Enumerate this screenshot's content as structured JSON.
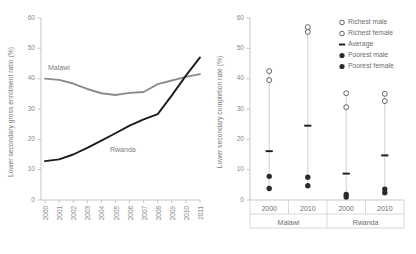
{
  "figure": {
    "title": "",
    "panels": [
      "enrolment-trend",
      "completion-equity"
    ]
  },
  "chart_data": [
    {
      "type": "line",
      "id": "lower-secondary-gross-enrolment-ratio",
      "title": "",
      "xlabel": "",
      "ylabel": "Lower secondary gross enrolment ratio (%)",
      "x": [
        2000,
        2001,
        2002,
        2003,
        2004,
        2005,
        2006,
        2007,
        2008,
        2009,
        2010,
        2011
      ],
      "xtick_labels": [
        "2000",
        "2001",
        "2002",
        "2003",
        "2004",
        "2005",
        "2006",
        "2007",
        "2008",
        "2009",
        "2010",
        "2011"
      ],
      "ytick_labels": [
        "0",
        "10",
        "20",
        "30",
        "40",
        "50",
        "60"
      ],
      "yticks": [
        0,
        10,
        20,
        30,
        40,
        50,
        60
      ],
      "ylim": [
        0,
        60
      ],
      "xlim": [
        2000,
        2011
      ],
      "grid": false,
      "legend": "inline-annotations",
      "series": [
        {
          "name": "Malawi",
          "color": "#8c8c8c",
          "label_text": "Malawi",
          "values": [
            40.0,
            39.6,
            38.4,
            36.6,
            35.2,
            34.6,
            35.3,
            35.6,
            38.2,
            39.4,
            40.6,
            41.5
          ]
        },
        {
          "name": "Rwanda",
          "color": "#1c1c1c",
          "label_text": "Rwanda",
          "values": [
            12.8,
            13.4,
            15.0,
            17.2,
            19.6,
            22.0,
            24.5,
            26.6,
            28.3,
            34.5,
            41.0,
            47.0
          ]
        }
      ]
    },
    {
      "type": "scatter",
      "id": "lower-secondary-completion-rate-by-wealth",
      "title": "",
      "xlabel": "",
      "ylabel": "Lower secondary completion rate (%)",
      "ytick_labels": [
        "0",
        "10",
        "20",
        "30",
        "40",
        "50",
        "60"
      ],
      "yticks": [
        0,
        10,
        20,
        30,
        40,
        50,
        60
      ],
      "ylim": [
        0,
        60
      ],
      "grid": false,
      "legend_position": "top-right",
      "legend_entries": [
        {
          "label": "Richest male",
          "marker": "open-circle",
          "color": "#4a4a4a"
        },
        {
          "label": "Richest female",
          "marker": "open-circle",
          "color": "#4a4a4a"
        },
        {
          "label": "Average",
          "marker": "dash",
          "color": "#1c1c1c"
        },
        {
          "label": "Poorest male",
          "marker": "filled-circle",
          "color": "#2b2b2b"
        },
        {
          "label": "Poorest female",
          "marker": "filled-circle",
          "color": "#2b2b2b"
        }
      ],
      "groups": [
        {
          "country": "Malawi",
          "year": "2000"
        },
        {
          "country": "Malawi",
          "year": "2010"
        },
        {
          "country": "Rwanda",
          "year": "2000"
        },
        {
          "country": "Rwanda",
          "year": "2010"
        }
      ],
      "categories": [
        "2000",
        "2010",
        "2000",
        "2010"
      ],
      "group_labels": [
        "Malawi",
        "Rwanda"
      ],
      "columns": [
        {
          "country": "Malawi",
          "year": "2000",
          "richest_male": 42.5,
          "richest_female": 39.5,
          "average": 16.1,
          "poorest_male": 7.8,
          "poorest_female": 3.8
        },
        {
          "country": "Malawi",
          "year": "2010",
          "richest_male": 57.0,
          "richest_female": 55.4,
          "average": 24.5,
          "poorest_male": 7.5,
          "poorest_female": 4.7
        },
        {
          "country": "Rwanda",
          "year": "2000",
          "richest_male": 35.2,
          "richest_female": 30.6,
          "average": 8.7,
          "poorest_male": 1.8,
          "poorest_female": 1.0
        },
        {
          "country": "Rwanda",
          "year": "2010",
          "richest_male": 35.0,
          "richest_female": 32.6,
          "average": 14.7,
          "poorest_male": 3.6,
          "poorest_female": 2.4
        }
      ]
    }
  ]
}
